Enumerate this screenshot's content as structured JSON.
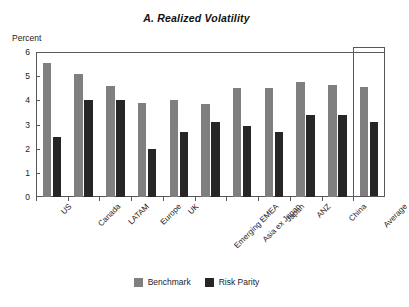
{
  "chart_data": {
    "type": "bar",
    "title": "A. Realized Volatility",
    "ylabel": "Percent",
    "xlabel": "",
    "ylim": [
      0,
      6
    ],
    "yticks": [
      0,
      1,
      2,
      3,
      4,
      5,
      6
    ],
    "grid": false,
    "legend_position": "bottom-center",
    "categories": [
      "US",
      "Canada",
      "LATAM",
      "Europe",
      "UK",
      "Emerging EMEA",
      "Asia ex Japan",
      "Japan",
      "ANZ",
      "China",
      "Average"
    ],
    "series": [
      {
        "name": "Benchmark",
        "color": "#7f7f7f",
        "values": [
          5.55,
          5.1,
          4.6,
          3.9,
          4.0,
          3.85,
          4.5,
          4.5,
          4.75,
          4.65,
          4.55
        ]
      },
      {
        "name": "Risk Parity",
        "color": "#262626",
        "values": [
          2.5,
          4.0,
          4.0,
          2.0,
          2.7,
          3.1,
          2.95,
          2.7,
          3.4,
          3.4,
          3.1
        ]
      }
    ],
    "annotations": [
      {
        "type": "highlight-box",
        "category": "Average"
      }
    ]
  },
  "colors": {
    "benchmark": "#7f7f7f",
    "risk_parity": "#262626",
    "axis": "#58585a",
    "text": "#222222",
    "background": "#ffffff"
  }
}
